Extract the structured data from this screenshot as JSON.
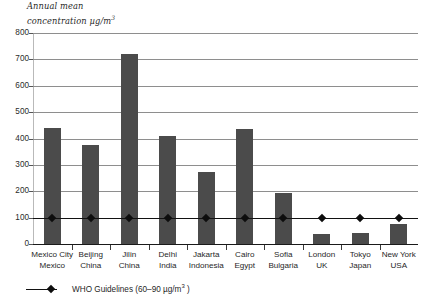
{
  "chart_data": {
    "type": "bar",
    "title": "",
    "subtitle": "",
    "ylabel_line1": "Annual mean",
    "ylabel_line2": "concentration µg/m",
    "ylabel_exponent": "3",
    "xlabel": "",
    "ylim": [
      0,
      800
    ],
    "ytick_step": 100,
    "yticks": [
      "800",
      "700",
      "600",
      "500",
      "400",
      "300",
      "200",
      "100",
      "0"
    ],
    "grid": "horizontal",
    "legend_position": "below-left",
    "bar_color": "#4b4b4b",
    "gridline_color": "#8e8e8e",
    "axis_color": "#1a1a1a",
    "categories": [
      {
        "city": "Mexico City",
        "country": "Mexico"
      },
      {
        "city": "Beijing",
        "country": "China"
      },
      {
        "city": "Jilin",
        "country": "China"
      },
      {
        "city": "Delhi",
        "country": "India"
      },
      {
        "city": "Jakarta",
        "country": "Indonesia"
      },
      {
        "city": "Cairo",
        "country": "Egypt"
      },
      {
        "city": "Sofia",
        "country": "Bulgaria"
      },
      {
        "city": "London",
        "country": "UK"
      },
      {
        "city": "Tokyo",
        "country": "Japan"
      },
      {
        "city": "New York",
        "country": "USA"
      }
    ],
    "values": [
      440,
      375,
      720,
      410,
      272,
      435,
      195,
      38,
      42,
      76
    ],
    "series": [
      {
        "name": "Annual mean concentration",
        "values": [
          440,
          375,
          720,
          410,
          272,
          435,
          195,
          38,
          42,
          76
        ]
      },
      {
        "name": "WHO Guidelines",
        "type": "line",
        "value": 100,
        "marker": "diamond"
      }
    ],
    "reference_line": {
      "label_prefix": "WHO Guidelines",
      "label_range": "(60–90 µg/m",
      "label_exponent": "3",
      "label_suffix": " )",
      "value": 100,
      "marker": "diamond-marker"
    }
  }
}
